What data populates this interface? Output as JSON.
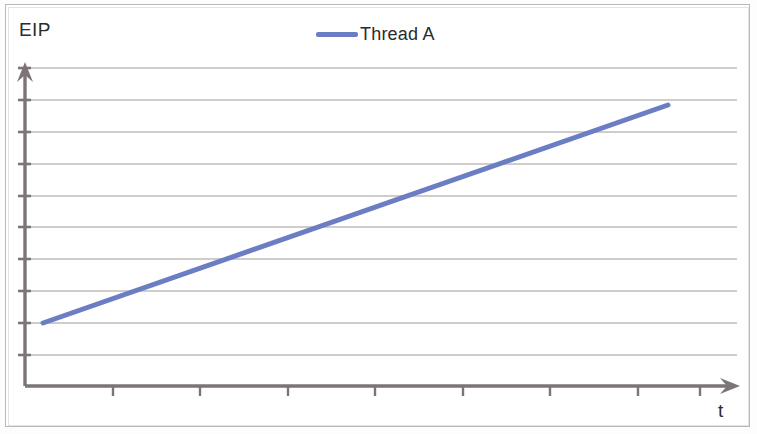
{
  "figure": {
    "background_color": "#ffffff",
    "frame_color": "#b9b9bb",
    "width": 757,
    "height": 434
  },
  "legend": {
    "position": "top-center",
    "entries": [
      {
        "label": "Thread A",
        "color": "#6b7ec4",
        "swatch": "line-swatch"
      }
    ],
    "thread_a_label": "Thread A"
  },
  "axes": {
    "y_label": "EIP",
    "x_label": "t",
    "axis_color": "#7d7479",
    "grid_color": "#b8b4b4",
    "y_arrow": "arrow-up-icon",
    "x_arrow": "arrow-right-icon",
    "gridlines_y": [
      68,
      100,
      132,
      164,
      196,
      227,
      259,
      291,
      323,
      355
    ],
    "x_ticks": [
      113,
      200,
      288,
      375,
      463,
      550,
      638,
      700
    ],
    "x_axis_y": 386,
    "y_axis_x": 25,
    "grid_left": 25,
    "grid_right": 737
  },
  "chart_data": {
    "type": "line",
    "title": "",
    "subtitle": "",
    "xlabel": "t",
    "ylabel": "EIP",
    "grid": true,
    "legend_position": "top-center",
    "xlim": [
      0,
      10
    ],
    "ylim": [
      0,
      10
    ],
    "x_tick_labels": [],
    "y_tick_labels": [],
    "series": [
      {
        "name": "Thread A",
        "color": "#6b7ec4",
        "line_width": 5,
        "x": [
          0.26,
          10.0
        ],
        "values": [
          2.0,
          8.85
        ],
        "points_px": [
          [
            43,
            323
          ],
          [
            668,
            105
          ]
        ],
        "description": "Single straight ascending line: EIP increases linearly with time"
      }
    ]
  }
}
